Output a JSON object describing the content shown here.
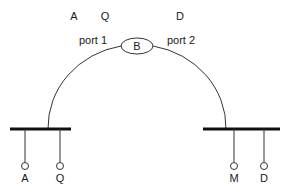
{
  "top_labels": [
    {
      "text": "A",
      "x": 74,
      "y": 20
    },
    {
      "text": "Q",
      "x": 105,
      "y": 20
    },
    {
      "text": "D",
      "x": 180,
      "y": 20
    }
  ],
  "ports": {
    "port1": {
      "label": "port 1",
      "x": 93,
      "y": 44
    },
    "port2": {
      "label": "port 2",
      "x": 181,
      "y": 44
    }
  },
  "center_node": {
    "label": "B",
    "cx": 137,
    "cy": 46,
    "rx": 16,
    "ry": 8
  },
  "buses": [
    {
      "name": "left",
      "x1": 10,
      "x2": 71,
      "y": 129,
      "arc_x": 48,
      "taps": [
        {
          "label": "A",
          "x": 25
        },
        {
          "label": "Q",
          "x": 60
        }
      ]
    },
    {
      "name": "right",
      "x1": 203,
      "x2": 280,
      "y": 129,
      "arc_x": 226,
      "taps": [
        {
          "label": "M",
          "x": 234
        },
        {
          "label": "D",
          "x": 264
        }
      ]
    }
  ],
  "colors": {
    "line": "#333333",
    "bus": "#111111"
  }
}
